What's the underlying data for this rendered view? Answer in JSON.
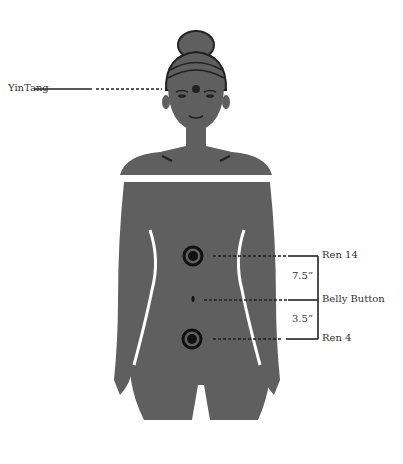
{
  "diagram": {
    "colors": {
      "body": "#5f5f5f",
      "line": "#222222",
      "text": "#333333",
      "background": "#ffffff"
    },
    "points": [
      {
        "id": "yintang",
        "label": "YinTang"
      },
      {
        "id": "ren14",
        "label": "Ren 14"
      },
      {
        "id": "belly",
        "label": "Belly Button"
      },
      {
        "id": "ren4",
        "label": "Ren 4"
      }
    ],
    "distances": [
      {
        "from": "Ren 14",
        "to": "Belly Button",
        "label": "7.5”"
      },
      {
        "from": "Belly Button",
        "to": "Ren 4",
        "label": "3.5”"
      }
    ]
  }
}
